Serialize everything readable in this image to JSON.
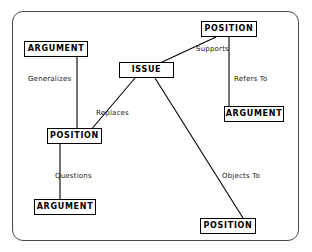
{
  "diagram": {
    "stroke_color": "#000000",
    "frame_color": "#4a4a4a",
    "background": "#ffffff",
    "nodes": [
      {
        "id": "position-top",
        "label": "POSITION",
        "x": 201,
        "y": 21,
        "w": 56,
        "h": 16
      },
      {
        "id": "argument-topleft",
        "label": "ARGUMENT",
        "x": 24,
        "y": 41,
        "w": 64,
        "h": 16
      },
      {
        "id": "issue",
        "label": "ISSUE",
        "x": 119,
        "y": 62,
        "w": 55,
        "h": 16
      },
      {
        "id": "argument-right",
        "label": "ARGUMENT",
        "x": 224,
        "y": 106,
        "w": 60,
        "h": 16
      },
      {
        "id": "position-left",
        "label": "POSITION",
        "x": 47,
        "y": 128,
        "w": 55,
        "h": 16
      },
      {
        "id": "argument-bottom",
        "label": "ARGUMENT",
        "x": 34,
        "y": 199,
        "w": 62,
        "h": 16
      },
      {
        "id": "position-bottom",
        "label": "POSITION",
        "x": 200,
        "y": 218,
        "w": 56,
        "h": 16
      }
    ],
    "edges": [
      {
        "id": "edge-supports",
        "label": "Supports",
        "x1": 160,
        "y1": 63,
        "x2": 216,
        "y2": 37,
        "label_x": 196,
        "label_y": 46
      },
      {
        "id": "edge-refers-to",
        "label": "Refers To",
        "x1": 229,
        "y1": 37,
        "x2": 229,
        "y2": 106,
        "label_x": 234,
        "label_y": 76
      },
      {
        "id": "edge-generalizes",
        "label": "Generalizes",
        "x1": 77,
        "y1": 57,
        "x2": 77,
        "y2": 128,
        "label_x": 28,
        "label_y": 76
      },
      {
        "id": "edge-replaces",
        "label": "Replaces",
        "x1": 135,
        "y1": 78,
        "x2": 90,
        "y2": 131,
        "label_x": 96,
        "label_y": 110
      },
      {
        "id": "edge-questions",
        "label": "Questions",
        "x1": 60,
        "y1": 144,
        "x2": 60,
        "y2": 199,
        "label_x": 55,
        "label_y": 173
      },
      {
        "id": "edge-objects-to",
        "label": "Objects To",
        "x1": 155,
        "y1": 78,
        "x2": 243,
        "y2": 218,
        "label_x": 222,
        "label_y": 173
      }
    ]
  }
}
